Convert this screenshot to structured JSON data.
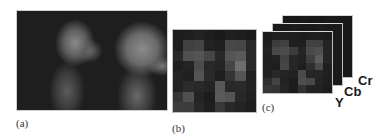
{
  "figure": {
    "panels": [
      {
        "id": "a",
        "caption": "(a)",
        "description": "Two grayscale head-and-shoulder photographs in profile on dark background"
      },
      {
        "id": "b",
        "caption": "(b)",
        "description": "8x8 block-averaged grayscale mosaic of the image"
      },
      {
        "id": "c",
        "caption": "(c)",
        "description": "Stack of three block mosaics, one per color channel"
      }
    ],
    "channels": [
      "Y",
      "Cb",
      "Cr"
    ],
    "colors": {
      "background": "#ffffff",
      "dark": "#1e1e1e",
      "text": "#333333"
    }
  },
  "mosaic_b": [
    [
      28,
      30,
      34,
      30,
      26,
      32,
      30,
      26
    ],
    [
      30,
      64,
      68,
      34,
      30,
      72,
      70,
      40
    ],
    [
      40,
      80,
      84,
      70,
      40,
      84,
      90,
      40
    ],
    [
      30,
      36,
      76,
      40,
      36,
      70,
      110,
      40
    ],
    [
      36,
      32,
      84,
      42,
      30,
      52,
      84,
      32
    ],
    [
      34,
      44,
      40,
      36,
      88,
      40,
      42,
      34
    ],
    [
      54,
      80,
      36,
      28,
      90,
      84,
      40,
      32
    ],
    [
      62,
      60,
      40,
      30,
      56,
      40,
      36,
      30
    ]
  ],
  "mosaic_y": [
    [
      28,
      30,
      32,
      30,
      28,
      30,
      30,
      28
    ],
    [
      30,
      60,
      64,
      32,
      30,
      66,
      64,
      36
    ],
    [
      34,
      72,
      76,
      60,
      36,
      74,
      80,
      36
    ],
    [
      30,
      34,
      66,
      38,
      34,
      62,
      92,
      36
    ],
    [
      32,
      30,
      70,
      38,
      30,
      46,
      74,
      30
    ],
    [
      32,
      40,
      36,
      34,
      74,
      38,
      38,
      32
    ],
    [
      46,
      66,
      34,
      28,
      78,
      72,
      36,
      30
    ],
    [
      54,
      52,
      36,
      28,
      50,
      36,
      34,
      28
    ]
  ],
  "mosaic_cb": [
    [
      26,
      26,
      28,
      26,
      26,
      28,
      26,
      26
    ],
    [
      26,
      30,
      30,
      26,
      26,
      30,
      30,
      26
    ],
    [
      26,
      32,
      32,
      30,
      26,
      32,
      32,
      26
    ],
    [
      26,
      26,
      30,
      26,
      26,
      30,
      34,
      26
    ],
    [
      26,
      26,
      30,
      26,
      26,
      28,
      30,
      26
    ],
    [
      26,
      28,
      26,
      26,
      30,
      26,
      26,
      26
    ],
    [
      28,
      30,
      26,
      26,
      32,
      30,
      26,
      26
    ],
    [
      30,
      28,
      26,
      26,
      28,
      26,
      26,
      26
    ]
  ],
  "mosaic_cr": [
    [
      24,
      24,
      26,
      24,
      24,
      26,
      24,
      24
    ],
    [
      24,
      28,
      28,
      24,
      24,
      28,
      28,
      24
    ],
    [
      24,
      30,
      30,
      28,
      24,
      30,
      30,
      24
    ],
    [
      24,
      24,
      28,
      24,
      24,
      28,
      32,
      24
    ],
    [
      24,
      24,
      28,
      24,
      24,
      26,
      28,
      24
    ],
    [
      24,
      26,
      24,
      24,
      28,
      24,
      24,
      24
    ],
    [
      26,
      28,
      24,
      24,
      30,
      28,
      24,
      24
    ],
    [
      28,
      26,
      24,
      24,
      26,
      24,
      24,
      24
    ]
  ]
}
